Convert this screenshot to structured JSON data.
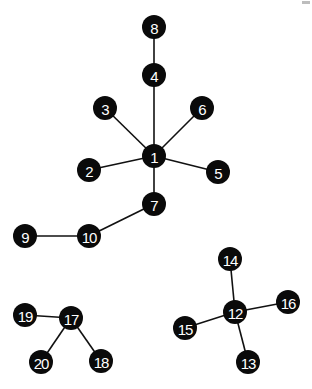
{
  "diagram": {
    "type": "network-graph",
    "node_radius": 12,
    "colors": {
      "background": "#ffffff",
      "node_fill": "#0a0a0a",
      "node_label": "#ffffff",
      "edge": "#111111"
    },
    "nodes": [
      {
        "id": "1",
        "label": "1",
        "x": 154,
        "y": 156
      },
      {
        "id": "2",
        "label": "2",
        "x": 89,
        "y": 170
      },
      {
        "id": "3",
        "label": "3",
        "x": 105,
        "y": 108
      },
      {
        "id": "4",
        "label": "4",
        "x": 154,
        "y": 75
      },
      {
        "id": "5",
        "label": "5",
        "x": 218,
        "y": 172
      },
      {
        "id": "6",
        "label": "6",
        "x": 202,
        "y": 108
      },
      {
        "id": "7",
        "label": "7",
        "x": 154,
        "y": 204
      },
      {
        "id": "8",
        "label": "8",
        "x": 154,
        "y": 27
      },
      {
        "id": "9",
        "label": "9",
        "x": 25,
        "y": 236
      },
      {
        "id": "10",
        "label": "10",
        "x": 89,
        "y": 236
      },
      {
        "id": "12",
        "label": "12",
        "x": 235,
        "y": 312
      },
      {
        "id": "13",
        "label": "13",
        "x": 248,
        "y": 362
      },
      {
        "id": "14",
        "label": "14",
        "x": 230,
        "y": 259
      },
      {
        "id": "15",
        "label": "15",
        "x": 185,
        "y": 328
      },
      {
        "id": "16",
        "label": "16",
        "x": 288,
        "y": 302
      },
      {
        "id": "17",
        "label": "17",
        "x": 71,
        "y": 318
      },
      {
        "id": "18",
        "label": "18",
        "x": 101,
        "y": 361
      },
      {
        "id": "19",
        "label": "19",
        "x": 25,
        "y": 315
      },
      {
        "id": "20",
        "label": "20",
        "x": 41,
        "y": 362
      }
    ],
    "edges": [
      {
        "from": "1",
        "to": "2"
      },
      {
        "from": "1",
        "to": "3"
      },
      {
        "from": "1",
        "to": "4"
      },
      {
        "from": "1",
        "to": "5"
      },
      {
        "from": "1",
        "to": "6"
      },
      {
        "from": "1",
        "to": "7"
      },
      {
        "from": "4",
        "to": "8"
      },
      {
        "from": "7",
        "to": "10"
      },
      {
        "from": "10",
        "to": "9"
      },
      {
        "from": "12",
        "to": "13"
      },
      {
        "from": "12",
        "to": "14"
      },
      {
        "from": "12",
        "to": "15"
      },
      {
        "from": "12",
        "to": "16"
      },
      {
        "from": "17",
        "to": "18"
      },
      {
        "from": "17",
        "to": "19"
      },
      {
        "from": "17",
        "to": "20"
      }
    ],
    "components": [
      [
        "1",
        "2",
        "3",
        "4",
        "5",
        "6",
        "7",
        "8",
        "9",
        "10"
      ],
      [
        "12",
        "13",
        "14",
        "15",
        "16"
      ],
      [
        "17",
        "18",
        "19",
        "20"
      ]
    ]
  }
}
